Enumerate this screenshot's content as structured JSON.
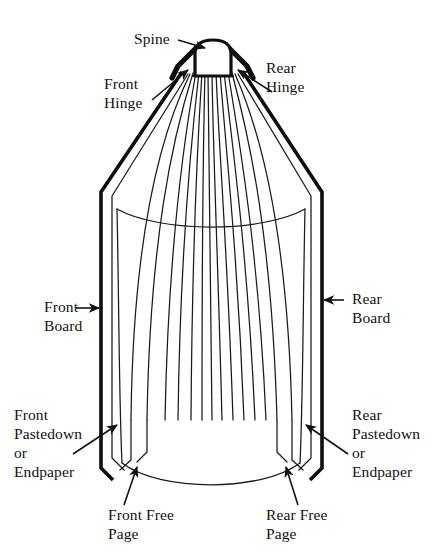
{
  "figure": {
    "background_color": "#ffffff",
    "ink_color": "#111111",
    "width": 432,
    "height": 560
  },
  "labels": {
    "spine": {
      "text": "Spine",
      "lines": [
        "Spine"
      ]
    },
    "front_hinge": {
      "text": "Front Hinge",
      "lines": [
        "Front",
        "Hinge"
      ]
    },
    "rear_hinge": {
      "text": "Rear Hinge",
      "lines": [
        "Rear",
        "Hinge"
      ]
    },
    "front_board": {
      "text": "Front Board",
      "lines": [
        "Front",
        "Board"
      ]
    },
    "rear_board": {
      "text": "Rear Board",
      "lines": [
        "Rear",
        "Board"
      ]
    },
    "front_pastedown": {
      "text": "Front Pastedown or Endpaper",
      "lines": [
        "Front",
        "Pastedown",
        "or",
        "Endpaper"
      ]
    },
    "rear_pastedown": {
      "text": "Rear Pastedown or Endpaper",
      "lines": [
        "Rear",
        "Pastedown",
        "or",
        "Endpaper"
      ]
    },
    "front_free_page": {
      "text": "Front Free Page",
      "lines": [
        "Front Free",
        "Page"
      ]
    },
    "rear_free_page": {
      "text": "Rear Free Page",
      "lines": [
        "Rear Free",
        "Page"
      ]
    }
  },
  "parts": {
    "spine_shape": "rounded-dome",
    "page_fan_count": 13,
    "boards": [
      "front-board",
      "rear-board"
    ],
    "hinges": [
      "front-hinge",
      "rear-hinge"
    ],
    "endpapers": [
      "front-pastedown",
      "rear-pastedown"
    ],
    "free_pages": [
      "front-free-page",
      "rear-free-page"
    ]
  }
}
